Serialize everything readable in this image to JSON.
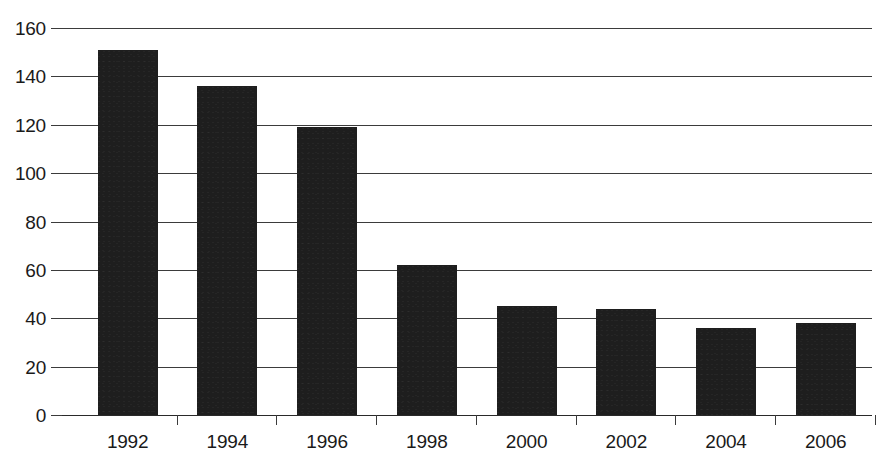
{
  "chart_data": {
    "type": "bar",
    "title": "",
    "subtitle": "",
    "xlabel": "",
    "ylabel": "",
    "categories": [
      "1992",
      "1994",
      "1996",
      "1998",
      "2000",
      "2002",
      "2004",
      "2006"
    ],
    "values": [
      151,
      136,
      119,
      62,
      45,
      44,
      36,
      38
    ],
    "ylim": [
      0,
      160
    ],
    "ytick_labels": [
      "0",
      "20",
      "40",
      "60",
      "80",
      "100",
      "120",
      "140",
      "160"
    ],
    "ytick_values": [
      0,
      20,
      40,
      60,
      80,
      100,
      120,
      140,
      160
    ],
    "grid": true,
    "grid_axis": "y",
    "legend": false,
    "legend_position": "none",
    "annotations": [],
    "colors": {
      "bar_fill": "#1e1e1e",
      "gridline": "#3b3b3b",
      "axis": "#2a2a2a",
      "text": "#1a1a1a",
      "background": "#ffffff"
    }
  }
}
